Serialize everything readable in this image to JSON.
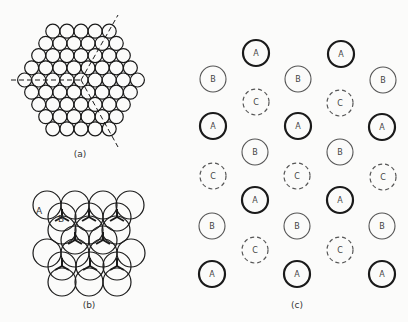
{
  "figure": {
    "panels": [
      {
        "id": "a",
        "label": "(a)",
        "description": "Hexagonal close-packed layer of spheres (rows 5,6,7,8,9,8,7,6,5) with dashed lines marking three-fold symmetry directions meeting at the center",
        "rows": [
          5,
          6,
          7,
          8,
          9,
          8,
          7,
          6,
          5
        ]
      },
      {
        "id": "b",
        "label": "(b)",
        "description": "Two close-packed layers stacked: layer A (plain circles) and layer B (circles with Y-shaped marks) sitting in hollows",
        "annotations": [
          "A",
          "B"
        ]
      },
      {
        "id": "c",
        "label": "(c)",
        "description": "Projection of ABC stacking positions: A (thick solid), B (thin solid), C (dashed)",
        "legend": {
          "A": "thick solid circle",
          "B": "thin solid circle",
          "C": "dashed circle"
        },
        "sites": [
          {
            "t": "A",
            "x": 256,
            "y": 53
          },
          {
            "t": "A",
            "x": 341,
            "y": 54
          },
          {
            "t": "B",
            "x": 213,
            "y": 79
          },
          {
            "t": "B",
            "x": 298,
            "y": 79
          },
          {
            "t": "B",
            "x": 383,
            "y": 80
          },
          {
            "t": "C",
            "x": 256,
            "y": 102
          },
          {
            "t": "C",
            "x": 340,
            "y": 103
          },
          {
            "t": "A",
            "x": 213,
            "y": 126
          },
          {
            "t": "A",
            "x": 298,
            "y": 126
          },
          {
            "t": "A",
            "x": 382,
            "y": 127
          },
          {
            "t": "B",
            "x": 255,
            "y": 152
          },
          {
            "t": "B",
            "x": 340,
            "y": 152
          },
          {
            "t": "C",
            "x": 213,
            "y": 176
          },
          {
            "t": "C",
            "x": 297,
            "y": 176
          },
          {
            "t": "C",
            "x": 383,
            "y": 177
          },
          {
            "t": "A",
            "x": 255,
            "y": 200
          },
          {
            "t": "A",
            "x": 340,
            "y": 200
          },
          {
            "t": "B",
            "x": 212,
            "y": 226
          },
          {
            "t": "B",
            "x": 297,
            "y": 226
          },
          {
            "t": "B",
            "x": 382,
            "y": 226
          },
          {
            "t": "C",
            "x": 255,
            "y": 250
          },
          {
            "t": "C",
            "x": 340,
            "y": 250
          },
          {
            "t": "A",
            "x": 212,
            "y": 274
          },
          {
            "t": "A",
            "x": 297,
            "y": 274
          },
          {
            "t": "A",
            "x": 382,
            "y": 274
          }
        ]
      }
    ],
    "colors": {
      "stroke": "#1a1a1a",
      "stroke_light": "#555555",
      "background": "#fbfbfa"
    }
  }
}
